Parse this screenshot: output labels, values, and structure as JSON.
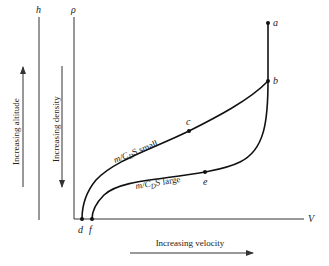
{
  "diagram": {
    "axes": {
      "altitude_axis_label": "h",
      "density_axis_label": "ρ",
      "velocity_axis_label": "V"
    },
    "annotations": {
      "altitude_arrow_text": "Increasing altitude",
      "density_arrow_text": "Increasing density",
      "velocity_arrow_text": "Increasing velocity"
    },
    "curves": [
      {
        "name": "small",
        "label_prefix": "m/C",
        "label_sub": "D",
        "label_suffix": "S small",
        "points": [
          "a",
          "b",
          "c",
          "d"
        ]
      },
      {
        "name": "large",
        "label_prefix": "m/C",
        "label_sub": "D",
        "label_suffix": "S large",
        "points": [
          "a",
          "b",
          "e",
          "f"
        ]
      }
    ],
    "points": {
      "a": "a",
      "b": "b",
      "c": "c",
      "d": "d",
      "e": "e",
      "f": "f"
    }
  }
}
